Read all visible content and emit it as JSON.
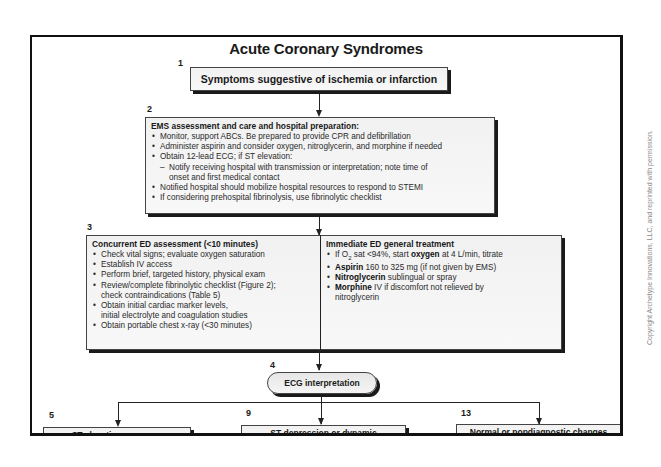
{
  "title": "Acute Coronary Syndromes",
  "steps": {
    "s1": {
      "number": "1",
      "label": "Symptoms suggestive of ischemia or infarction"
    },
    "s2": {
      "number": "2",
      "header": "EMS assessment and care and hospital preparation:",
      "items": [
        "Monitor, support ABCs. Be prepared to provide CPR and defibrillation",
        "Administer aspirin and consider oxygen, nitroglycerin, and morphine if needed",
        "Obtain 12-lead ECG; if ST elevation:",
        "Notify receiving hospital with transmission or interpretation; note time of",
        "onset and first medical contact",
        "Notified hospital should mobilize hospital resources to respond to STEMI",
        "If considering prehospital fibrinolysis, use fibrinolytic checklist"
      ]
    },
    "s3": {
      "number": "3",
      "left": {
        "header": "Concurrent ED assessment (<10 minutes)",
        "items": [
          "Check vital signs; evaluate oxygen saturation",
          "Establish IV access",
          "Perform brief, targeted history, physical exam",
          "Review/complete fibrinolytic checklist (Figure 2);",
          "check contraindications (Table 5)",
          "Obtain initial cardiac marker levels,",
          "initial electrolyte and coagulation studies",
          "Obtain portable chest x-ray (<30 minutes)"
        ]
      },
      "right": {
        "header": "Immediate ED general treatment",
        "items": [
          {
            "pre": "If O",
            "sub": "2",
            "mid": " sat <94%, start ",
            "bold": "oxygen",
            "post": " at 4 L/min, titrate"
          },
          {
            "bold": "Aspirin",
            "post": " 160 to 325 mg (if not given by EMS)"
          },
          {
            "bold": "Nitroglycerin",
            "post": " sublingual or spray"
          },
          {
            "bold": "Morphine",
            "post": " IV if discomfort not relieved by"
          },
          {
            "post": "nitroglycerin"
          }
        ]
      }
    },
    "s4": {
      "number": "4",
      "label": "ECG interpretation"
    },
    "s5": {
      "number": "5",
      "label": "ST elevation or new or"
    },
    "s9": {
      "number": "9",
      "label": "ST depression or dynamic"
    },
    "s13": {
      "number": "13",
      "label": "Normal or nondiagnostic changes"
    }
  },
  "copyright": "Copyright Archetype Innovations, LLC, and reprinted with permission."
}
